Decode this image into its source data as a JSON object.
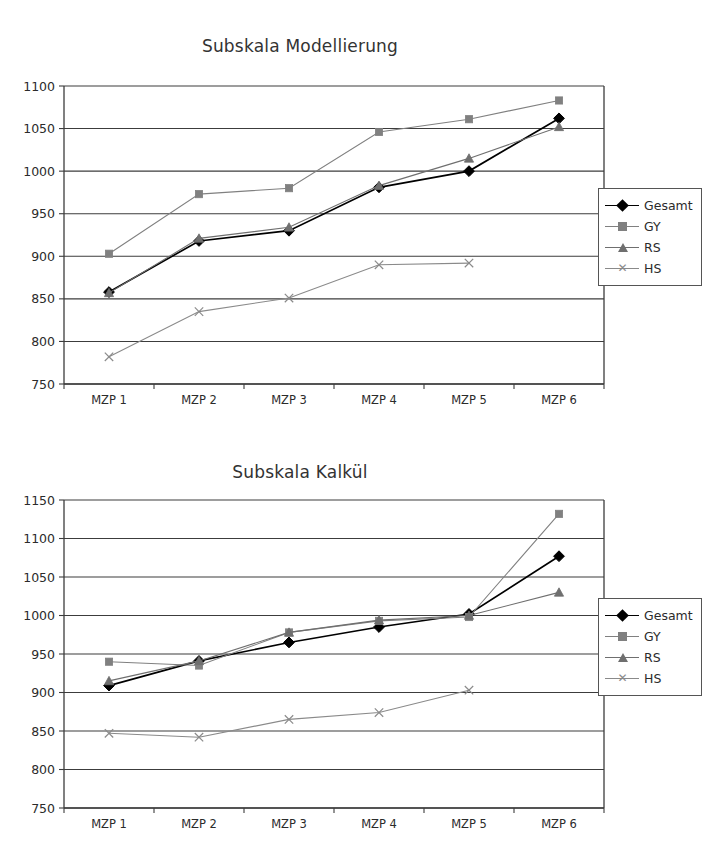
{
  "figures": [
    {
      "id": "modellierung",
      "title": "Subskala Modellierung",
      "legend": {
        "items": [
          {
            "label": "Gesamt",
            "marker": "diamond-marker-icon",
            "color": "#000000"
          },
          {
            "label": "GY",
            "marker": "square-marker-icon",
            "color": "#808080"
          },
          {
            "label": "RS",
            "marker": "triangle-marker-icon",
            "color": "#6f6f6f"
          },
          {
            "label": "HS",
            "marker": "cross-marker-icon",
            "color": "#8a8a8a"
          }
        ]
      }
    },
    {
      "id": "kalkuel",
      "title": "Subskala Kalkül",
      "legend": {
        "items": [
          {
            "label": "Gesamt",
            "marker": "diamond-marker-icon",
            "color": "#000000"
          },
          {
            "label": "GY",
            "marker": "square-marker-icon",
            "color": "#808080"
          },
          {
            "label": "RS",
            "marker": "triangle-marker-icon",
            "color": "#6f6f6f"
          },
          {
            "label": "HS",
            "marker": "cross-marker-icon",
            "color": "#8a8a8a"
          }
        ]
      }
    }
  ],
  "chart_data": [
    {
      "type": "line",
      "title": "Subskala Modellierung",
      "xlabel": "",
      "ylabel": "",
      "categories": [
        "MZP 1",
        "MZP 2",
        "MZP 3",
        "MZP 4",
        "MZP 5",
        "MZP 6"
      ],
      "ylim": [
        750,
        1100
      ],
      "yticks": [
        750,
        800,
        850,
        900,
        950,
        1000,
        1050,
        1100
      ],
      "grid": "horizontal",
      "legend_position": "right",
      "series": [
        {
          "name": "Gesamt",
          "color": "#000000",
          "marker": "diamond",
          "values": [
            858,
            918,
            930,
            981,
            1000,
            1062
          ]
        },
        {
          "name": "GY",
          "color": "#808080",
          "marker": "square",
          "values": [
            903,
            973,
            980,
            1046,
            1061,
            1083
          ]
        },
        {
          "name": "RS",
          "color": "#6f6f6f",
          "marker": "triangle",
          "values": [
            857,
            921,
            934,
            983,
            1015,
            1052
          ]
        },
        {
          "name": "HS",
          "color": "#8a8a8a",
          "marker": "cross",
          "values": [
            782,
            835,
            851,
            890,
            892,
            null
          ]
        }
      ]
    },
    {
      "type": "line",
      "title": "Subskala Kalkül",
      "xlabel": "",
      "ylabel": "",
      "categories": [
        "MZP 1",
        "MZP 2",
        "MZP 3",
        "MZP 4",
        "MZP 5",
        "MZP 6"
      ],
      "ylim": [
        750,
        1150
      ],
      "yticks": [
        750,
        800,
        850,
        900,
        950,
        1000,
        1050,
        1100,
        1150
      ],
      "grid": "horizontal",
      "legend_position": "right",
      "series": [
        {
          "name": "Gesamt",
          "color": "#000000",
          "marker": "diamond",
          "values": [
            909,
            941,
            965,
            985,
            1002,
            1077
          ]
        },
        {
          "name": "GY",
          "color": "#808080",
          "marker": "square",
          "values": [
            940,
            935,
            978,
            993,
            998,
            1132
          ]
        },
        {
          "name": "RS",
          "color": "#6f6f6f",
          "marker": "triangle",
          "values": [
            915,
            941,
            978,
            994,
            1000,
            1030
          ]
        },
        {
          "name": "HS",
          "color": "#8a8a8a",
          "marker": "cross",
          "values": [
            847,
            842,
            865,
            874,
            903,
            null
          ]
        }
      ]
    }
  ]
}
